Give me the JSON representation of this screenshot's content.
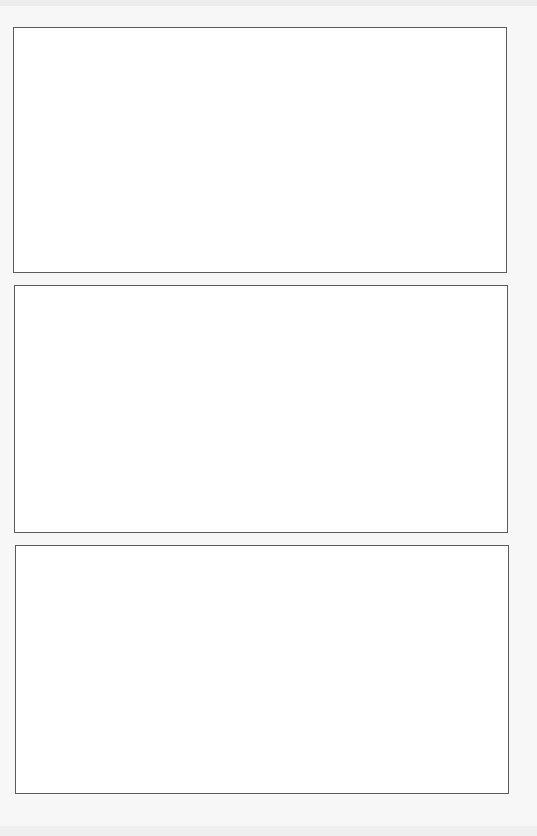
{
  "page": {
    "type": "blank storyboard / comic page",
    "background_color": "#f7f7f7",
    "border_color": "#5a5a5a",
    "panels": [
      {
        "id": "panel-1",
        "content": ""
      },
      {
        "id": "panel-2",
        "content": ""
      },
      {
        "id": "panel-3",
        "content": ""
      }
    ]
  }
}
